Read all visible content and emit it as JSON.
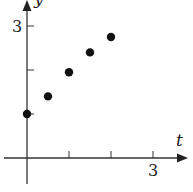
{
  "chart_data": {
    "type": "scatter",
    "title": "",
    "xlabel": "t",
    "ylabel": "y",
    "x_tick_labels": [
      {
        "value": 3,
        "label": "3"
      }
    ],
    "y_tick_labels": [
      {
        "value": 3,
        "label": "3"
      }
    ],
    "x_ticks": [
      1,
      2,
      3
    ],
    "y_ticks": [
      1,
      2,
      3
    ],
    "xlim": [
      -0.6,
      3.9
    ],
    "ylim": [
      -0.6,
      3.6
    ],
    "grid": false,
    "legend": null,
    "series": [
      {
        "name": "data",
        "points": [
          {
            "x": 0,
            "y": 1.0
          },
          {
            "x": 0.5,
            "y": 1.4
          },
          {
            "x": 1.0,
            "y": 1.95
          },
          {
            "x": 1.5,
            "y": 2.4
          },
          {
            "x": 2.0,
            "y": 2.75
          }
        ]
      }
    ],
    "colors": {
      "axis": "#333333",
      "points": "#111111",
      "background": "#ffffff"
    }
  }
}
